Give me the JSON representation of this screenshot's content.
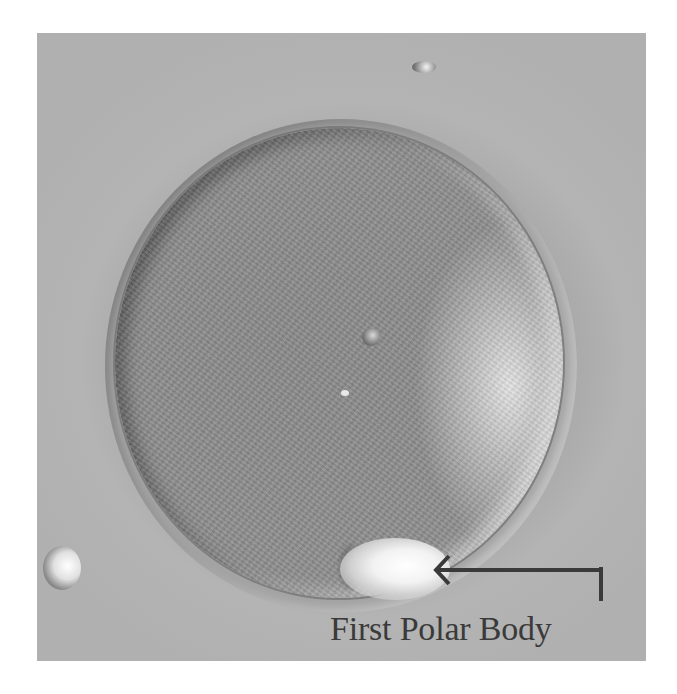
{
  "figure": {
    "annotation": {
      "label": "First Polar Body",
      "arrow_direction": "left"
    },
    "colors": {
      "background": "#ffffff",
      "image_tone": "#a3a3a3",
      "label_color": "#3a3a3a"
    }
  }
}
